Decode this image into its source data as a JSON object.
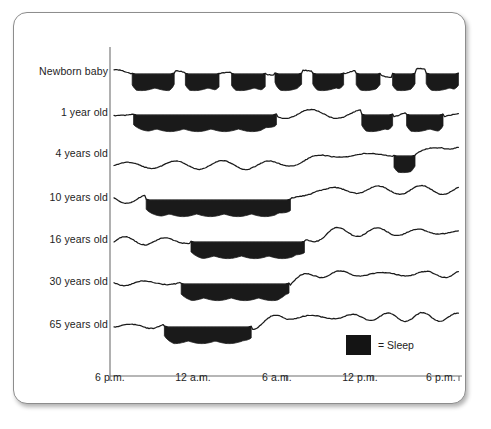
{
  "figure": {
    "legend": {
      "label": "= Sleep",
      "swatch_color": "#141414",
      "swatch_name": "sleep-swatch"
    },
    "axis_color": "#6f6f6f",
    "line_color": "#1a1a1a",
    "text_color": "#1d1d1d"
  },
  "x_axis": {
    "ticks": [
      {
        "label": "6 p.m.",
        "hour": 18
      },
      {
        "label": "12 a.m.",
        "hour": 24
      },
      {
        "label": "6 a.m.",
        "hour": 30
      },
      {
        "label": "12 p.m.",
        "hour": 36
      },
      {
        "label": "6 p.m.",
        "hour": 42
      }
    ],
    "range_hours": [
      18,
      42
    ]
  },
  "y_axis": {
    "labels": [
      "Newborn baby",
      "1 year old",
      "4 years old",
      "10 years old",
      "16 years old",
      "30 years old",
      "65 years old"
    ]
  },
  "chart_data": {
    "type": "area",
    "xlabel": "Time of day",
    "ylabel": "Age group",
    "xlim": [
      18,
      42
    ],
    "grid": false,
    "legend_position": "bottom-right",
    "x_tick_labels": [
      "6 p.m.",
      "12 a.m.",
      "6 a.m.",
      "12 p.m.",
      "6 p.m."
    ],
    "x_tick_hours": [
      18,
      24,
      30,
      36,
      42
    ],
    "note": "Filled (black) spans denote sleep; the wavy line is the arousal/activity trace. Hours are continuous from 18 (6 p.m.) to 42 (6 p.m. next day).",
    "series": [
      {
        "name": "Newborn baby",
        "total_sleep_hours": 16,
        "sleep_spans": [
          [
            19.2,
            22.2
          ],
          [
            22.9,
            25.4
          ],
          [
            26.1,
            28.6
          ],
          [
            29.2,
            31.1
          ],
          [
            31.8,
            34.0
          ],
          [
            34.8,
            36.6
          ],
          [
            37.3,
            39.0
          ],
          [
            39.7,
            42.0
          ]
        ]
      },
      {
        "name": "1 year old",
        "total_sleep_hours": 13,
        "sleep_spans": [
          [
            19.3,
            29.3
          ],
          [
            35.2,
            37.4
          ],
          [
            38.3,
            40.9
          ]
        ]
      },
      {
        "name": "4 years old",
        "total_sleep_hours": 11,
        "sleep_spans": [
          [
            37.4,
            39.0
          ]
        ]
      },
      {
        "name": "10 years old",
        "total_sleep_hours": 10,
        "sleep_spans": [
          [
            20.2,
            30.3
          ]
        ]
      },
      {
        "name": "16 years old",
        "total_sleep_hours": 8.5,
        "sleep_spans": [
          [
            23.3,
            31.3
          ]
        ]
      },
      {
        "name": "30 years old",
        "total_sleep_hours": 7.5,
        "sleep_spans": [
          [
            22.6,
            30.2
          ]
        ]
      },
      {
        "name": "65 years old",
        "total_sleep_hours": 6,
        "sleep_spans": [
          [
            21.5,
            27.6
          ]
        ]
      }
    ],
    "row_y_centers": [
      60,
      101,
      142,
      186,
      228,
      270,
      313
    ]
  }
}
